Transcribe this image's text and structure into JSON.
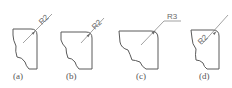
{
  "figure": {
    "panels": [
      {
        "id": "a",
        "caption": "(a)",
        "dimension": "R2",
        "dimension_placement": "outside-along-leader"
      },
      {
        "id": "b",
        "caption": "(b)",
        "dimension": "R2",
        "dimension_placement": "outside-along-leader"
      },
      {
        "id": "c",
        "caption": "(c)",
        "dimension": "R3",
        "dimension_placement": "outside-on-shelf"
      },
      {
        "id": "d",
        "caption": "(d)",
        "dimension": "R2",
        "dimension_placement": "inside-along-leader"
      }
    ]
  }
}
